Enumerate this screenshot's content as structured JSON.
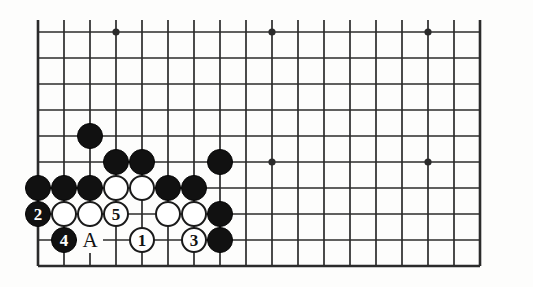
{
  "figure": {
    "kind": "go-board-diagram",
    "width": 533,
    "height": 287,
    "background_color": "#fdfdfc",
    "line_color": "#2b2b2b",
    "black_stone_color": "#111111",
    "white_stone_color": "#ffffff"
  },
  "board": {
    "origin_x": 38,
    "origin_y": 32,
    "step": 26,
    "columns": 18,
    "rows": 10,
    "edges": {
      "left": true,
      "right": true,
      "top": false,
      "bottom": true
    },
    "overhang_top": 12,
    "star_points": [
      {
        "col": 3,
        "row": 0
      },
      {
        "col": 9,
        "row": 0
      },
      {
        "col": 15,
        "row": 0
      },
      {
        "col": 9,
        "row": 5
      },
      {
        "col": 15,
        "row": 5
      }
    ]
  },
  "stones": [
    {
      "id": "b1",
      "color": "black",
      "col": 2,
      "row": 4,
      "label": ""
    },
    {
      "id": "b2",
      "color": "black",
      "col": 3,
      "row": 5,
      "label": ""
    },
    {
      "id": "b3",
      "color": "black",
      "col": 4,
      "row": 5,
      "label": ""
    },
    {
      "id": "b4",
      "color": "black",
      "col": 7,
      "row": 5,
      "label": ""
    },
    {
      "id": "b5",
      "color": "black",
      "col": 0,
      "row": 6,
      "label": ""
    },
    {
      "id": "b6",
      "color": "black",
      "col": 1,
      "row": 6,
      "label": ""
    },
    {
      "id": "b7",
      "color": "black",
      "col": 2,
      "row": 6,
      "label": ""
    },
    {
      "id": "w1",
      "color": "white",
      "col": 3,
      "row": 6,
      "label": ""
    },
    {
      "id": "w2",
      "color": "white",
      "col": 4,
      "row": 6,
      "label": ""
    },
    {
      "id": "b8",
      "color": "black",
      "col": 5,
      "row": 6,
      "label": ""
    },
    {
      "id": "b9",
      "color": "black",
      "col": 6,
      "row": 6,
      "label": ""
    },
    {
      "id": "b10",
      "color": "black",
      "col": 0,
      "row": 7,
      "label": "2"
    },
    {
      "id": "w3",
      "color": "white",
      "col": 1,
      "row": 7,
      "label": ""
    },
    {
      "id": "w4",
      "color": "white",
      "col": 2,
      "row": 7,
      "label": ""
    },
    {
      "id": "w5",
      "color": "white",
      "col": 3,
      "row": 7,
      "label": "5"
    },
    {
      "id": "w6",
      "color": "white",
      "col": 5,
      "row": 7,
      "label": ""
    },
    {
      "id": "w7",
      "color": "white",
      "col": 6,
      "row": 7,
      "label": ""
    },
    {
      "id": "b11",
      "color": "black",
      "col": 7,
      "row": 7,
      "label": ""
    },
    {
      "id": "b12",
      "color": "black",
      "col": 1,
      "row": 8,
      "label": "4"
    },
    {
      "id": "w8",
      "color": "white",
      "col": 4,
      "row": 8,
      "label": "1"
    },
    {
      "id": "w9",
      "color": "white",
      "col": 6,
      "row": 8,
      "label": "3"
    },
    {
      "id": "b13",
      "color": "black",
      "col": 7,
      "row": 8,
      "label": ""
    }
  ],
  "point_labels": [
    {
      "id": "pa",
      "text": "A",
      "col": 2,
      "row": 8
    }
  ],
  "legend": {
    "move_numbers": [
      "1",
      "2",
      "3",
      "4",
      "5"
    ],
    "letter_marks": [
      "A"
    ]
  }
}
